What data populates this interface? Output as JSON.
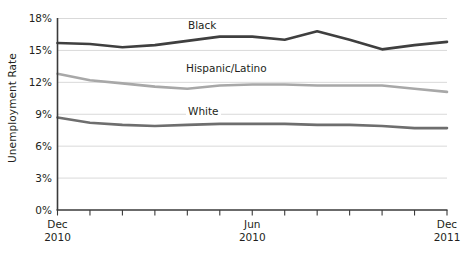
{
  "chart_data": {
    "type": "line",
    "title": "",
    "xlabel": "",
    "ylabel": "Unemployment Rate",
    "ylim": [
      0,
      18
    ],
    "ytick_values": [
      0,
      3,
      6,
      9,
      12,
      15,
      18
    ],
    "ytick_labels": [
      "0%",
      "3%",
      "6%",
      "9%",
      "12%",
      "15%",
      "18%"
    ],
    "grid": true,
    "legend_position": "inline-annotations",
    "x": [
      "Dec 2010",
      "Jan 2011",
      "Feb 2011",
      "Mar 2011",
      "Apr 2011",
      "May 2011",
      "Jun 2011",
      "Jul 2011",
      "Aug 2011",
      "Sep 2011",
      "Oct 2011",
      "Nov 2011",
      "Dec 2011"
    ],
    "xtick_labeled": [
      {
        "index": 0,
        "line1": "Dec",
        "line2": "2010"
      },
      {
        "index": 6,
        "line1": "Jun",
        "line2": "2010"
      },
      {
        "index": 12,
        "line1": "Dec",
        "line2": "2011"
      }
    ],
    "series": [
      {
        "name": "Black",
        "color": "#3f3f3f",
        "width": 2.6,
        "values": [
          15.7,
          15.6,
          15.3,
          15.5,
          15.9,
          16.3,
          16.3,
          16.0,
          16.8,
          16.0,
          15.1,
          15.5,
          15.8
        ]
      },
      {
        "name": "Hispanic/Latino",
        "color": "#a8a8a8",
        "width": 2.6,
        "values": [
          12.8,
          12.2,
          11.9,
          11.6,
          11.4,
          11.7,
          11.8,
          11.8,
          11.7,
          11.7,
          11.7,
          11.4,
          11.1
        ]
      },
      {
        "name": "White",
        "color": "#6e6e6e",
        "width": 2.6,
        "values": [
          8.7,
          8.2,
          8.0,
          7.9,
          8.0,
          8.1,
          8.1,
          8.1,
          8.0,
          8.0,
          7.9,
          7.7,
          7.7
        ]
      }
    ],
    "annotations": [
      {
        "text": "Black",
        "x_px": 186,
        "y_px": 19
      },
      {
        "text": "Hispanic/Latino",
        "x_px": 184,
        "y_px": 62
      },
      {
        "text": "White",
        "x_px": 186,
        "y_px": 105
      }
    ]
  },
  "axis": {
    "y_title": "Unemployment Rate"
  },
  "colors": {
    "black_series": "#3f3f3f",
    "hispanic_series": "#a8a8a8",
    "white_series": "#6e6e6e",
    "gridline": "#c9c9c9",
    "axis": "#3a3a3a",
    "text": "#231f20",
    "background": "#ffffff"
  }
}
